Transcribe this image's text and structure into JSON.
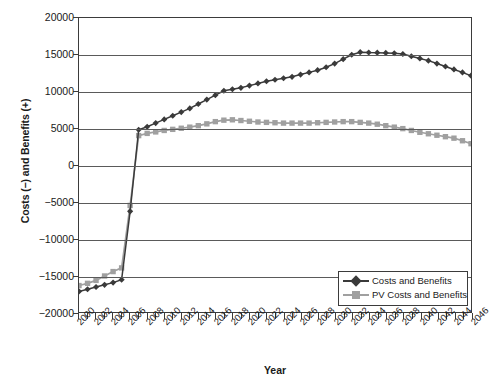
{
  "chart_data": {
    "type": "line",
    "title": "",
    "xlabel": "Year",
    "ylabel": "Costs (−) and Benefits (+)",
    "ylim": [
      -20000,
      20000
    ],
    "xlim": [
      2000,
      2046
    ],
    "grid": true,
    "legend_position": "bottom-right",
    "y_ticks": [
      20000,
      15000,
      10000,
      5000,
      0,
      -5000,
      -10000,
      -15000,
      -20000
    ],
    "y_tick_labels": [
      "20000",
      "15000",
      "10000",
      "5000",
      "0",
      "−5000",
      "−10000",
      "−15000",
      "−20000"
    ],
    "x_tick_labels": [
      "2000",
      "2002",
      "2004",
      "2006",
      "2008",
      "2010",
      "2012",
      "2014",
      "2016",
      "2018",
      "2020",
      "2022",
      "2024",
      "2026",
      "2028",
      "2030",
      "2032",
      "2034",
      "2036",
      "2038",
      "2040",
      "2042",
      "2044",
      "2046"
    ],
    "x": [
      2000,
      2001,
      2002,
      2003,
      2004,
      2005,
      2006,
      2007,
      2008,
      2009,
      2010,
      2011,
      2012,
      2013,
      2014,
      2015,
      2016,
      2017,
      2018,
      2019,
      2020,
      2021,
      2022,
      2023,
      2024,
      2025,
      2026,
      2027,
      2028,
      2029,
      2030,
      2031,
      2032,
      2033,
      2034,
      2035,
      2036,
      2037,
      2038,
      2039,
      2040,
      2041,
      2042,
      2043,
      2044,
      2045,
      2046
    ],
    "series": [
      {
        "name": "Costs and Benefits",
        "color": "#3a3a3a",
        "marker": "diamond",
        "values": [
          -17200,
          -16900,
          -16600,
          -16300,
          -16000,
          -15600,
          -6300,
          4800,
          5200,
          5700,
          6200,
          6700,
          7200,
          7700,
          8300,
          8900,
          9500,
          10100,
          10300,
          10500,
          10800,
          11100,
          11400,
          11600,
          11800,
          12000,
          12300,
          12600,
          12900,
          13300,
          13800,
          14400,
          15000,
          15350,
          15300,
          15280,
          15250,
          15200,
          15100,
          14800,
          14500,
          14200,
          13800,
          13400,
          13000,
          12600,
          12150
        ]
      },
      {
        "name": "PV Costs and Benefits",
        "color": "#a0a0a0",
        "marker": "square",
        "values": [
          -16400,
          -16100,
          -15700,
          -15100,
          -14500,
          -14000,
          -5500,
          4000,
          4300,
          4500,
          4700,
          4850,
          5000,
          5150,
          5350,
          5600,
          5900,
          6100,
          6150,
          6050,
          5950,
          5850,
          5800,
          5750,
          5700,
          5700,
          5700,
          5700,
          5750,
          5800,
          5850,
          5900,
          5900,
          5800,
          5700,
          5550,
          5350,
          5150,
          4950,
          4700,
          4450,
          4250,
          4050,
          3850,
          3650,
          3300,
          2900
        ]
      }
    ]
  },
  "legend": {
    "items": [
      {
        "label": "Costs and Benefits",
        "color": "#3a3a3a",
        "marker": "diamond"
      },
      {
        "label": "PV Costs and Benefits",
        "color": "#a0a0a0",
        "marker": "square"
      }
    ]
  },
  "axis": {
    "y_title": "Costs (−) and Benefits (+)",
    "x_title": "Year"
  }
}
